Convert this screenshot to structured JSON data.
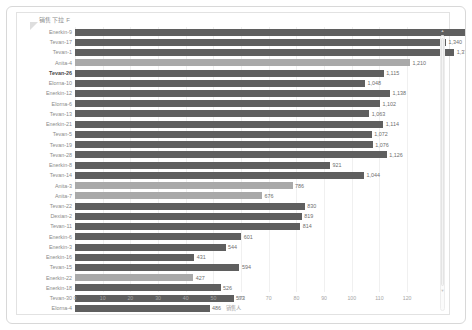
{
  "panel": {
    "title": "销售下拉 F",
    "filter_icon": "filter-caret-icon",
    "scroll_up_icon": "scroll-up-icon",
    "scroll_down_icon": "scroll-down-icon"
  },
  "chart_data": {
    "type": "bar",
    "orientation": "horizontal",
    "title": "销售下拉 F",
    "xlabel": "销售人",
    "ylabel": "",
    "xlim": [
      0,
      125
    ],
    "grid": true,
    "legend": "none",
    "value_scale_note": "bar length axis in units of 10; data labels are raw counts",
    "xticks": [
      0,
      10,
      20,
      30,
      40,
      50,
      60,
      70,
      80,
      90,
      100,
      110,
      120
    ],
    "xtick_labels": [
      "0",
      "10",
      "20",
      "30",
      "40",
      "50",
      "60",
      "70",
      "80",
      "90",
      "100",
      "110",
      "120"
    ],
    "categories": [
      "Enerkin-9",
      "Tevan-17",
      "Tevan-1",
      "Anita-4",
      "Tevan-26",
      "Elorna-10",
      "Enerkin-12",
      "Elorna-6",
      "Tevan-13",
      "Enerkin-21",
      "Tevan-5",
      "Tevan-19",
      "Tevan-28",
      "Enerkin-8",
      "Tevan-14",
      "Anita-3",
      "Anita-7",
      "Tevan-22",
      "Dexian-2",
      "Tevan-11",
      "Enerkin-6",
      "Enerkin-3",
      "Enerkin-16",
      "Tevan-15",
      "Enerkin-22",
      "Enerkin-18",
      "Tevan-30",
      "Elorna-4"
    ],
    "values": [
      1429,
      1340,
      1370,
      1210,
      1115,
      1048,
      1138,
      1102,
      1063,
      1114,
      1072,
      1076,
      1126,
      921,
      1044,
      786,
      676,
      830,
      819,
      814,
      601,
      544,
      431,
      594,
      427,
      526,
      573,
      486
    ],
    "value_labels": [
      "1,429",
      "1,340",
      "1,370",
      "1,210",
      "1,115",
      "1,048",
      "1,138",
      "1,102",
      "1,063",
      "1,114",
      "1,072",
      "1,076",
      "1,126",
      "921",
      "1,044",
      "786",
      "676",
      "830",
      "819",
      "814",
      "601",
      "544",
      "431",
      "594",
      "427",
      "526",
      "573",
      "486"
    ],
    "highlighted_categories": [
      "Anita-4",
      "Anita-3",
      "Anita-7",
      "Enerkin-22"
    ],
    "selected_category": "Tevan-26",
    "bar_color": "#5f5f5f",
    "highlight_color": "#a9a9a9",
    "label_color": "#8a8a8a",
    "value_label_color": "#6e6e6e",
    "grid_color": "#f0f0f0",
    "panel_border_color": "#d8d8d8"
  }
}
